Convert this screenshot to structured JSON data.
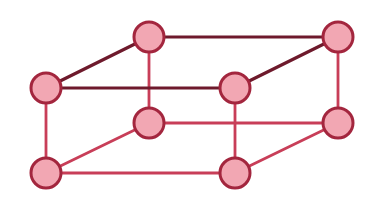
{
  "diagram": {
    "type": "cuboid-lattice",
    "colors": {
      "node_fill": "#f2a7b3",
      "node_stroke": "#a3263e",
      "top_edge": "#6e1a2c",
      "lower_edge": "#c83e58",
      "background": "#ffffff"
    },
    "node_radius": 15,
    "nodes": [
      {
        "id": "top-back-left",
        "x": 149,
        "y": 37
      },
      {
        "id": "top-back-right",
        "x": 338,
        "y": 37
      },
      {
        "id": "top-front-left",
        "x": 46,
        "y": 88
      },
      {
        "id": "top-front-right",
        "x": 235,
        "y": 88
      },
      {
        "id": "bottom-back-left",
        "x": 149,
        "y": 123
      },
      {
        "id": "bottom-back-right",
        "x": 338,
        "y": 123
      },
      {
        "id": "bottom-front-left",
        "x": 46,
        "y": 173
      },
      {
        "id": "bottom-front-right",
        "x": 235,
        "y": 173
      }
    ],
    "edges": [
      {
        "from": "top-back-left",
        "to": "top-back-right",
        "style": "top"
      },
      {
        "from": "top-front-left",
        "to": "top-front-right",
        "style": "top"
      },
      {
        "from": "top-front-left",
        "to": "top-back-left",
        "style": "top"
      },
      {
        "from": "top-front-right",
        "to": "top-back-right",
        "style": "top"
      },
      {
        "from": "top-back-left",
        "to": "bottom-back-left",
        "style": "lower"
      },
      {
        "from": "top-back-right",
        "to": "bottom-back-right",
        "style": "lower"
      },
      {
        "from": "top-front-left",
        "to": "bottom-front-left",
        "style": "lower"
      },
      {
        "from": "top-front-right",
        "to": "bottom-front-right",
        "style": "lower"
      },
      {
        "from": "bottom-back-left",
        "to": "bottom-back-right",
        "style": "lower"
      },
      {
        "from": "bottom-front-left",
        "to": "bottom-front-right",
        "style": "lower"
      },
      {
        "from": "bottom-front-left",
        "to": "bottom-back-left",
        "style": "lower"
      },
      {
        "from": "bottom-front-right",
        "to": "bottom-back-right",
        "style": "lower"
      }
    ]
  }
}
